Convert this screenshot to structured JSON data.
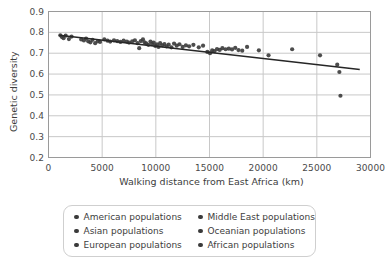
{
  "chart_data": {
    "type": "scatter",
    "title": "",
    "xlabel": "Walking distance from East Africa (km)",
    "ylabel": "Genetic diversity",
    "xlim": [
      0,
      30000
    ],
    "ylim": [
      0.2,
      0.9
    ],
    "xticks": [
      0,
      5000,
      10000,
      15000,
      20000,
      25000,
      30000
    ],
    "xticklabels": [
      "0",
      "5000",
      "10000",
      "15000",
      "20000",
      "25000",
      "30000"
    ],
    "yticks": [
      0.2,
      0.3,
      0.4,
      0.5,
      0.6,
      0.7,
      0.8,
      0.9
    ],
    "yticklabels": [
      "0.2",
      "0.3",
      "0.4",
      "0.5",
      "0.6",
      "0.7",
      "0.8",
      "0.9"
    ],
    "grid": true,
    "grid_color": "#c8c8c8",
    "marker_color": "#3a3a3a",
    "marker_size": 4.2,
    "trendline": {
      "label": "linear regression",
      "color": "#262626",
      "width": 1.6,
      "x": [
        1000,
        29000
      ],
      "y": [
        0.786,
        0.622
      ]
    },
    "points": [
      {
        "x": 1100,
        "y": 0.786
      },
      {
        "x": 1250,
        "y": 0.778
      },
      {
        "x": 1400,
        "y": 0.772
      },
      {
        "x": 1600,
        "y": 0.784
      },
      {
        "x": 1900,
        "y": 0.768
      },
      {
        "x": 2150,
        "y": 0.78
      },
      {
        "x": 3050,
        "y": 0.766
      },
      {
        "x": 3300,
        "y": 0.761
      },
      {
        "x": 3500,
        "y": 0.77
      },
      {
        "x": 3700,
        "y": 0.757
      },
      {
        "x": 3900,
        "y": 0.752
      },
      {
        "x": 4100,
        "y": 0.764
      },
      {
        "x": 4350,
        "y": 0.748
      },
      {
        "x": 4600,
        "y": 0.758
      },
      {
        "x": 4800,
        "y": 0.754
      },
      {
        "x": 5200,
        "y": 0.766
      },
      {
        "x": 5500,
        "y": 0.76
      },
      {
        "x": 5750,
        "y": 0.756
      },
      {
        "x": 6100,
        "y": 0.762
      },
      {
        "x": 6400,
        "y": 0.758
      },
      {
        "x": 6700,
        "y": 0.754
      },
      {
        "x": 7000,
        "y": 0.76
      },
      {
        "x": 7300,
        "y": 0.756
      },
      {
        "x": 7500,
        "y": 0.751
      },
      {
        "x": 7800,
        "y": 0.757
      },
      {
        "x": 8050,
        "y": 0.762
      },
      {
        "x": 8300,
        "y": 0.748
      },
      {
        "x": 8450,
        "y": 0.724
      },
      {
        "x": 8600,
        "y": 0.758
      },
      {
        "x": 8800,
        "y": 0.766
      },
      {
        "x": 8950,
        "y": 0.752
      },
      {
        "x": 9100,
        "y": 0.747
      },
      {
        "x": 9300,
        "y": 0.74
      },
      {
        "x": 9500,
        "y": 0.756
      },
      {
        "x": 9650,
        "y": 0.744
      },
      {
        "x": 9800,
        "y": 0.751
      },
      {
        "x": 9950,
        "y": 0.735
      },
      {
        "x": 10100,
        "y": 0.742
      },
      {
        "x": 10250,
        "y": 0.73
      },
      {
        "x": 10400,
        "y": 0.748
      },
      {
        "x": 10600,
        "y": 0.738
      },
      {
        "x": 10800,
        "y": 0.744
      },
      {
        "x": 11000,
        "y": 0.733
      },
      {
        "x": 11200,
        "y": 0.741
      },
      {
        "x": 11450,
        "y": 0.728
      },
      {
        "x": 11700,
        "y": 0.746
      },
      {
        "x": 11950,
        "y": 0.736
      },
      {
        "x": 12200,
        "y": 0.743
      },
      {
        "x": 12500,
        "y": 0.73
      },
      {
        "x": 12800,
        "y": 0.738
      },
      {
        "x": 13100,
        "y": 0.733
      },
      {
        "x": 13500,
        "y": 0.74
      },
      {
        "x": 14000,
        "y": 0.728
      },
      {
        "x": 14400,
        "y": 0.736
      },
      {
        "x": 14800,
        "y": 0.706
      },
      {
        "x": 15050,
        "y": 0.7
      },
      {
        "x": 15250,
        "y": 0.714
      },
      {
        "x": 15450,
        "y": 0.71
      },
      {
        "x": 15700,
        "y": 0.72
      },
      {
        "x": 15950,
        "y": 0.716
      },
      {
        "x": 16200,
        "y": 0.724
      },
      {
        "x": 16500,
        "y": 0.719
      },
      {
        "x": 16800,
        "y": 0.722
      },
      {
        "x": 17100,
        "y": 0.718
      },
      {
        "x": 17400,
        "y": 0.726
      },
      {
        "x": 17700,
        "y": 0.715
      },
      {
        "x": 18050,
        "y": 0.712
      },
      {
        "x": 18500,
        "y": 0.73
      },
      {
        "x": 19600,
        "y": 0.714
      },
      {
        "x": 20500,
        "y": 0.69
      },
      {
        "x": 22700,
        "y": 0.719
      },
      {
        "x": 25300,
        "y": 0.69
      },
      {
        "x": 26900,
        "y": 0.645
      },
      {
        "x": 27100,
        "y": 0.61
      },
      {
        "x": 27200,
        "y": 0.496
      }
    ],
    "legend": {
      "position": "below-axes",
      "ncol": 2,
      "entries": [
        {
          "label": "American populations",
          "marker": "circle",
          "color": "#3a3a3a"
        },
        {
          "label": "Middle East populations",
          "marker": "circle",
          "color": "#3a3a3a"
        },
        {
          "label": "Asian populations",
          "marker": "circle",
          "color": "#3a3a3a"
        },
        {
          "label": "Oceanian populations",
          "marker": "circle",
          "color": "#3a3a3a"
        },
        {
          "label": "European populations",
          "marker": "circle",
          "color": "#3a3a3a"
        },
        {
          "label": "African populations",
          "marker": "circle",
          "color": "#3a3a3a"
        }
      ]
    }
  }
}
